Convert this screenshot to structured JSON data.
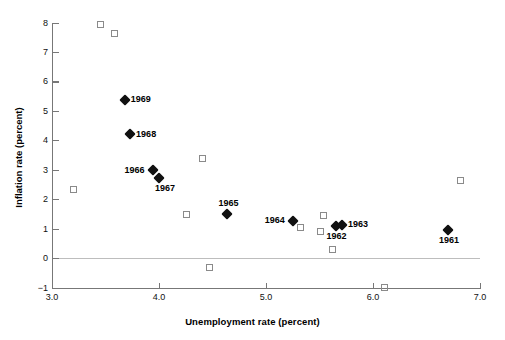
{
  "chart_data": {
    "type": "scatter",
    "title": "",
    "xlabel": "Unemployment rate (percent)",
    "ylabel": "Inflation rate (percent)",
    "xlim": [
      3.0,
      7.0
    ],
    "ylim": [
      -1,
      8
    ],
    "xticks": [
      "3.0",
      "4.0",
      "5.0",
      "6.0",
      "7.0"
    ],
    "xtick_values": [
      3.0,
      4.0,
      5.0,
      6.0,
      7.0
    ],
    "yticks": [
      "8",
      "7",
      "6",
      "5",
      "4",
      "3",
      "2",
      "1",
      "0",
      "-1"
    ],
    "ytick_values": [
      8,
      7,
      6,
      5,
      4,
      3,
      2,
      1,
      0,
      -1
    ],
    "grid": false,
    "legend": "none",
    "zero_reference_line": 0,
    "series": [
      {
        "name": "labeled-years",
        "marker": "filled-diamond",
        "color": "#111111",
        "points": [
          {
            "label": "1969",
            "x": 3.68,
            "y": 5.4,
            "label_pos": "right"
          },
          {
            "label": "1968",
            "x": 3.73,
            "y": 4.22,
            "label_pos": "right"
          },
          {
            "label": "1966",
            "x": 3.94,
            "y": 3.0,
            "label_pos": "left"
          },
          {
            "label": "1967",
            "x": 4.0,
            "y": 2.75,
            "label_pos": "below-right"
          },
          {
            "label": "1965",
            "x": 4.64,
            "y": 1.53,
            "label_pos": "above"
          },
          {
            "label": "1964",
            "x": 5.25,
            "y": 1.28,
            "label_pos": "left"
          },
          {
            "label": "1962",
            "x": 5.65,
            "y": 1.1,
            "label_pos": "below"
          },
          {
            "label": "1963",
            "x": 5.71,
            "y": 1.15,
            "label_pos": "right"
          },
          {
            "label": "1961",
            "x": 6.7,
            "y": 0.98,
            "label_pos": "below"
          }
        ]
      },
      {
        "name": "other-years",
        "marker": "open-square",
        "color": "#8a8a8a",
        "points": [
          {
            "x": 3.46,
            "y": 7.92
          },
          {
            "x": 3.59,
            "y": 7.62
          },
          {
            "x": 3.21,
            "y": 2.3
          },
          {
            "x": 4.42,
            "y": 3.35
          },
          {
            "x": 4.27,
            "y": 1.45
          },
          {
            "x": 5.33,
            "y": 1.02
          },
          {
            "x": 5.55,
            "y": 1.42
          },
          {
            "x": 5.52,
            "y": 0.87
          },
          {
            "x": 5.63,
            "y": 0.28
          },
          {
            "x": 4.48,
            "y": -0.33
          },
          {
            "x": 6.12,
            "y": -1.02
          },
          {
            "x": 6.83,
            "y": 2.62
          }
        ]
      }
    ]
  },
  "colors": {
    "axis": "#777777",
    "zero_line": "#bdbdbd",
    "diamond": "#111111",
    "square_stroke": "#8a8a8a",
    "text": "#000000",
    "background": "#ffffff"
  }
}
